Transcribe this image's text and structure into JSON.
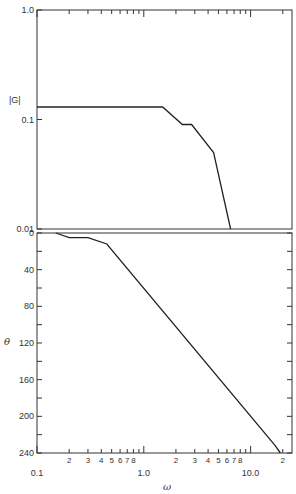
{
  "chart_data": [
    {
      "type": "line",
      "title": "",
      "xlabel": "",
      "ylabel": "|G|",
      "xscale": "log",
      "yscale": "log",
      "xlim": [
        0.1,
        20
      ],
      "ylim": [
        0.01,
        1.0
      ],
      "grid": false,
      "y_tick_labels": [
        "1.0",
        "0.1",
        "0.01"
      ],
      "series": [
        {
          "name": "|G|",
          "x": [
            0.1,
            1.5,
            2.3,
            2.8,
            4.5,
            6.5
          ],
          "y": [
            0.13,
            0.13,
            0.09,
            0.09,
            0.05,
            0.01
          ]
        }
      ]
    },
    {
      "type": "line",
      "title": "",
      "xlabel": "ω",
      "ylabel": "θ",
      "xscale": "log",
      "xlim": [
        0.1,
        20
      ],
      "ylim": [
        0,
        240
      ],
      "y_inverted": true,
      "grid": false,
      "y_tick_labels": [
        "0",
        "40",
        "80",
        "120",
        "160",
        "200",
        "240"
      ],
      "x_tick_labels": [
        "0.1",
        "2",
        "3",
        "4",
        "5",
        "6",
        "7",
        "8",
        "1.0",
        "2",
        "3",
        "4",
        "5",
        "6",
        "7",
        "8",
        "10.0",
        "2"
      ],
      "series": [
        {
          "name": "θ",
          "x": [
            0.15,
            0.2,
            0.3,
            0.45,
            17,
            19
          ],
          "y": [
            0,
            5,
            5,
            12,
            232,
            240
          ]
        }
      ]
    }
  ],
  "labels": {
    "mag_axis": "|G|",
    "phase_axis": "θ",
    "x_axis": "ω",
    "mag_ticks": [
      "1.0",
      "0.1",
      "0.01"
    ],
    "phase_ticks": [
      "0",
      "40",
      "80",
      "120",
      "160",
      "200",
      "240"
    ],
    "x_decades": [
      "0.1",
      "1.0",
      "10.0"
    ],
    "x_minor": [
      "2",
      "3",
      "4",
      "5",
      "6",
      "7",
      "8"
    ],
    "x_last": "2"
  }
}
